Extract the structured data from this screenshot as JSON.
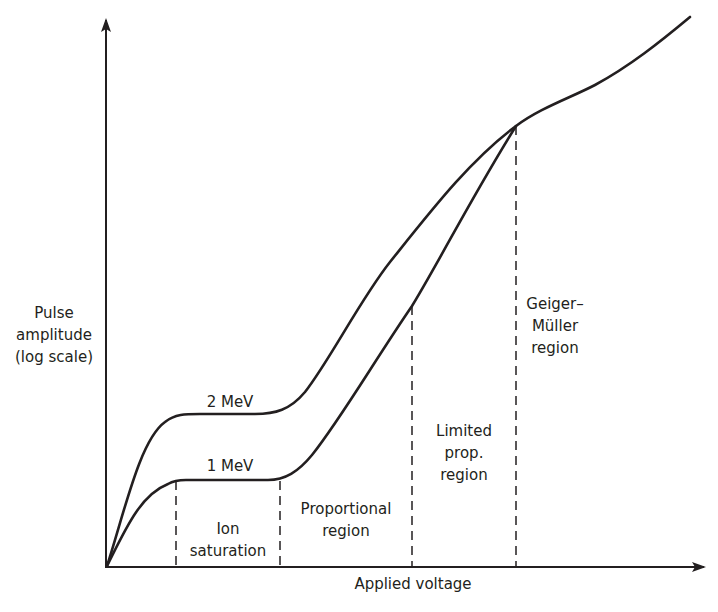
{
  "diagram": {
    "type": "gas-detector-pulse-amplitude-regions",
    "y_axis": {
      "label_lines": [
        "Pulse",
        "amplitude",
        "(log scale)"
      ]
    },
    "x_axis": {
      "label": "Applied voltage"
    },
    "curves": [
      {
        "name": "2 MeV",
        "label": "2 MeV"
      },
      {
        "name": "1 MeV",
        "label": "1 MeV"
      }
    ],
    "regions": [
      {
        "name": "ion-saturation",
        "label_lines": [
          "Ion",
          "saturation"
        ]
      },
      {
        "name": "proportional",
        "label_lines": [
          "Proportional",
          "region"
        ]
      },
      {
        "name": "limited-proportional",
        "label_lines": [
          "Limited",
          "prop.",
          "region"
        ]
      },
      {
        "name": "geiger-muller",
        "label_lines": [
          "Geiger–",
          "Müller",
          "region"
        ]
      }
    ],
    "colors": {
      "line": "#231f20",
      "background": "#ffffff"
    }
  }
}
